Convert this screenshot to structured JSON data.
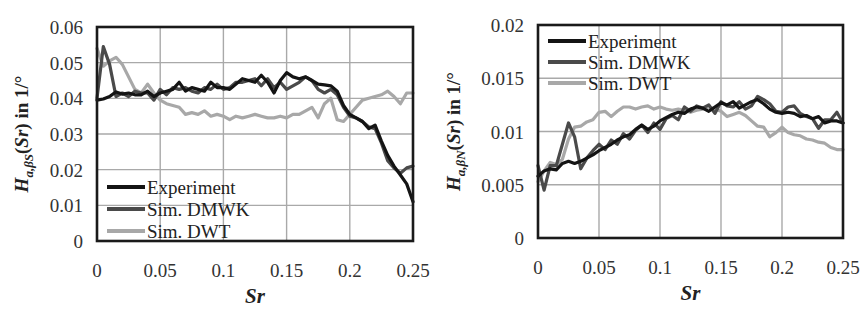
{
  "figure": {
    "colors": {
      "experiment": "#141414",
      "sim_dmwk": "#4a4a4a",
      "sim_dwt": "#a8a8a8",
      "grid": "#a9a9a9",
      "frame": "#1a1a1a"
    }
  },
  "left": {
    "ylabel_main": "H",
    "ylabel_sub": "a,βS",
    "ylabel_rest": "(Sr) in 1/°",
    "xlabel": "Sr",
    "yticks": [
      "0",
      "0.01",
      "0.02",
      "0.03",
      "0.04",
      "0.05",
      "0.06"
    ],
    "xticks": [
      "0",
      "0.05",
      "0.1",
      "0.15",
      "0.2",
      "0.25"
    ],
    "legend": [
      "Experiment",
      "Sim. DMWK",
      "Sim. DWT"
    ]
  },
  "right": {
    "ylabel_main": "H",
    "ylabel_sub": "a,βN",
    "ylabel_rest": "(Sr) in 1/°",
    "xlabel": "Sr",
    "yticks": [
      "0",
      "0.005",
      "0.01",
      "0.015",
      "0.02"
    ],
    "xticks": [
      "0",
      "0.05",
      "0.1",
      "0.15",
      "0.2",
      "0.25"
    ],
    "legend": [
      "Experiment",
      "Sim. DMWK",
      "Sim. DWT"
    ]
  },
  "chart_data": [
    {
      "type": "line",
      "title": "",
      "xlabel": "Sr",
      "ylabel": "H_{a,βS}(Sr) in 1/°",
      "xlim": [
        0,
        0.25
      ],
      "ylim": [
        0,
        0.06
      ],
      "grid": true,
      "legend_position": "lower left",
      "x": [
        0,
        0.005,
        0.01,
        0.015,
        0.02,
        0.025,
        0.03,
        0.035,
        0.04,
        0.045,
        0.05,
        0.055,
        0.06,
        0.065,
        0.07,
        0.075,
        0.08,
        0.085,
        0.09,
        0.095,
        0.1,
        0.105,
        0.11,
        0.115,
        0.12,
        0.125,
        0.13,
        0.135,
        0.14,
        0.145,
        0.15,
        0.155,
        0.16,
        0.165,
        0.17,
        0.175,
        0.18,
        0.185,
        0.19,
        0.195,
        0.2,
        0.205,
        0.21,
        0.215,
        0.22,
        0.225,
        0.23,
        0.235,
        0.24,
        0.245,
        0.25
      ],
      "series": [
        {
          "name": "Experiment",
          "values": [
            0.0395,
            0.0398,
            0.0405,
            0.0418,
            0.0412,
            0.0415,
            0.041,
            0.041,
            0.042,
            0.0405,
            0.0415,
            0.042,
            0.0425,
            0.0445,
            0.042,
            0.043,
            0.0425,
            0.042,
            0.0445,
            0.043,
            0.043,
            0.0425,
            0.044,
            0.0455,
            0.045,
            0.0445,
            0.0465,
            0.0445,
            0.0415,
            0.045,
            0.0472,
            0.046,
            0.0455,
            0.046,
            0.045,
            0.044,
            0.0438,
            0.0435,
            0.042,
            0.038,
            0.0355,
            0.0345,
            0.0335,
            0.0315,
            0.0325,
            0.028,
            0.024,
            0.021,
            0.0185,
            0.016,
            0.011
          ]
        },
        {
          "name": "Sim. DMWK",
          "values": [
            0.04,
            0.0545,
            0.0495,
            0.0405,
            0.0415,
            0.0405,
            0.042,
            0.0415,
            0.0415,
            0.0395,
            0.0425,
            0.041,
            0.043,
            0.0425,
            0.043,
            0.042,
            0.0415,
            0.043,
            0.0425,
            0.044,
            0.0425,
            0.043,
            0.0445,
            0.0445,
            0.045,
            0.0455,
            0.0435,
            0.0455,
            0.043,
            0.0445,
            0.0425,
            0.0435,
            0.0445,
            0.046,
            0.045,
            0.0425,
            0.0415,
            0.0425,
            0.041,
            0.0375,
            0.035,
            0.0345,
            0.0335,
            0.032,
            0.0315,
            0.0275,
            0.0225,
            0.0205,
            0.019,
            0.0205,
            0.021
          ]
        },
        {
          "name": "Sim. DWT",
          "values": [
            0.054,
            0.049,
            0.0505,
            0.0515,
            0.0495,
            0.046,
            0.0425,
            0.0415,
            0.044,
            0.0415,
            0.0395,
            0.0385,
            0.038,
            0.0375,
            0.0355,
            0.036,
            0.0355,
            0.0365,
            0.035,
            0.0355,
            0.035,
            0.034,
            0.035,
            0.0345,
            0.035,
            0.0355,
            0.035,
            0.0345,
            0.0345,
            0.035,
            0.0345,
            0.0355,
            0.0355,
            0.0365,
            0.0375,
            0.0345,
            0.0385,
            0.04,
            0.034,
            0.0335,
            0.0355,
            0.0375,
            0.0395,
            0.04,
            0.0405,
            0.041,
            0.042,
            0.0405,
            0.0385,
            0.0415,
            0.0415
          ]
        }
      ]
    },
    {
      "type": "line",
      "title": "",
      "xlabel": "Sr",
      "ylabel": "H_{a,βN}(Sr) in 1/°",
      "xlim": [
        0,
        0.25
      ],
      "ylim": [
        0,
        0.02
      ],
      "grid": true,
      "legend_position": "upper left",
      "x": [
        0,
        0.005,
        0.01,
        0.015,
        0.02,
        0.025,
        0.03,
        0.035,
        0.04,
        0.045,
        0.05,
        0.055,
        0.06,
        0.065,
        0.07,
        0.075,
        0.08,
        0.085,
        0.09,
        0.095,
        0.1,
        0.105,
        0.11,
        0.115,
        0.12,
        0.125,
        0.13,
        0.135,
        0.14,
        0.145,
        0.15,
        0.155,
        0.16,
        0.165,
        0.17,
        0.175,
        0.18,
        0.185,
        0.19,
        0.195,
        0.2,
        0.205,
        0.21,
        0.215,
        0.22,
        0.225,
        0.23,
        0.235,
        0.24,
        0.245,
        0.25
      ],
      "series": [
        {
          "name": "Experiment",
          "values": [
            0.0058,
            0.0063,
            0.0065,
            0.0064,
            0.007,
            0.0072,
            0.007,
            0.0072,
            0.0075,
            0.0078,
            0.0082,
            0.0085,
            0.0088,
            0.0092,
            0.0095,
            0.0097,
            0.0102,
            0.0106,
            0.0102,
            0.0105,
            0.011,
            0.0113,
            0.0116,
            0.0118,
            0.0117,
            0.0121,
            0.0123,
            0.0122,
            0.0119,
            0.0123,
            0.0127,
            0.0125,
            0.0128,
            0.0122,
            0.0125,
            0.0128,
            0.013,
            0.0126,
            0.0121,
            0.0118,
            0.0117,
            0.0118,
            0.0117,
            0.0114,
            0.0115,
            0.0112,
            0.0114,
            0.0108,
            0.011,
            0.011,
            0.0108
          ]
        },
        {
          "name": "Sim. DMWK",
          "values": [
            0.0068,
            0.0045,
            0.0068,
            0.0068,
            0.0088,
            0.0108,
            0.0095,
            0.0065,
            0.0075,
            0.0082,
            0.0088,
            0.0083,
            0.0092,
            0.0088,
            0.0098,
            0.0093,
            0.0101,
            0.0106,
            0.0099,
            0.0108,
            0.0102,
            0.0112,
            0.0115,
            0.0111,
            0.0123,
            0.0119,
            0.0124,
            0.0122,
            0.0125,
            0.0117,
            0.0128,
            0.0124,
            0.0123,
            0.0128,
            0.0121,
            0.0124,
            0.0133,
            0.013,
            0.0126,
            0.0119,
            0.0118,
            0.0123,
            0.0124,
            0.0117,
            0.0114,
            0.0112,
            0.0103,
            0.0111,
            0.0111,
            0.0118,
            0.0108
          ]
        },
        {
          "name": "Sim. DWT",
          "values": [
            0.0053,
            0.0063,
            0.0071,
            0.0069,
            0.0074,
            0.0093,
            0.0104,
            0.0105,
            0.0109,
            0.0111,
            0.0118,
            0.0119,
            0.0114,
            0.0119,
            0.0123,
            0.0123,
            0.0121,
            0.0123,
            0.0124,
            0.0121,
            0.0123,
            0.0121,
            0.012,
            0.0121,
            0.012,
            0.0118,
            0.012,
            0.0121,
            0.0123,
            0.0121,
            0.0119,
            0.0114,
            0.0116,
            0.0118,
            0.0115,
            0.011,
            0.0105,
            0.0104,
            0.0095,
            0.0099,
            0.0104,
            0.0099,
            0.0097,
            0.0096,
            0.0093,
            0.0092,
            0.009,
            0.0089,
            0.0085,
            0.0083,
            0.0083
          ]
        }
      ]
    }
  ]
}
